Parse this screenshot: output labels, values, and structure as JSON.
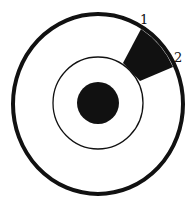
{
  "diagram": {
    "labels": {
      "point1": "1",
      "point2": "2"
    },
    "colors": {
      "stroke": "#111111",
      "fill": "#111111",
      "background": "#ffffff"
    }
  }
}
